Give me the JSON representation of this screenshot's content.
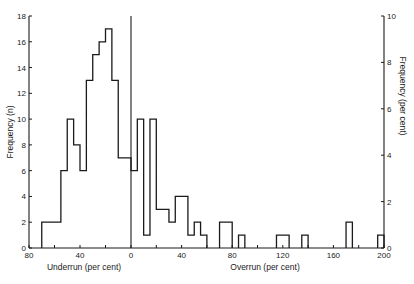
{
  "chart_data": {
    "type": "bar",
    "subtype": "histogram",
    "title": "",
    "xlabel_left": "Underrun (per cent)",
    "xlabel_right": "Overrun (per cent)",
    "ylabel_left": "Frequency (n)",
    "ylabel_right": "Frequency (per cent)",
    "x_ticks_underrun": [
      80,
      40,
      0
    ],
    "x_ticks_overrun": [
      40,
      80,
      120,
      160,
      200
    ],
    "y_ticks_left": [
      0,
      2,
      4,
      6,
      8,
      10,
      12,
      14,
      16,
      18
    ],
    "y_ticks_right": [
      0,
      2,
      4,
      6,
      8,
      10
    ],
    "ylim_left": [
      0,
      18
    ],
    "ylim_right": [
      0,
      10
    ],
    "xlim": [
      -80,
      200
    ],
    "bin_width_percent": 5,
    "grid": false,
    "legend": null,
    "bins": [
      {
        "from": -70,
        "to": -65,
        "n": 2
      },
      {
        "from": -65,
        "to": -60,
        "n": 2
      },
      {
        "from": -60,
        "to": -55,
        "n": 2
      },
      {
        "from": -55,
        "to": -50,
        "n": 6
      },
      {
        "from": -50,
        "to": -45,
        "n": 10
      },
      {
        "from": -45,
        "to": -40,
        "n": 8
      },
      {
        "from": -40,
        "to": -35,
        "n": 6
      },
      {
        "from": -35,
        "to": -30,
        "n": 13
      },
      {
        "from": -30,
        "to": -25,
        "n": 15
      },
      {
        "from": -25,
        "to": -20,
        "n": 16
      },
      {
        "from": -20,
        "to": -15,
        "n": 17
      },
      {
        "from": -15,
        "to": -10,
        "n": 13
      },
      {
        "from": -10,
        "to": -5,
        "n": 7
      },
      {
        "from": -5,
        "to": 0,
        "n": 7
      },
      {
        "from": 0,
        "to": 5,
        "n": 6
      },
      {
        "from": 5,
        "to": 10,
        "n": 10
      },
      {
        "from": 10,
        "to": 15,
        "n": 1
      },
      {
        "from": 15,
        "to": 20,
        "n": 10
      },
      {
        "from": 20,
        "to": 25,
        "n": 3
      },
      {
        "from": 25,
        "to": 30,
        "n": 3
      },
      {
        "from": 30,
        "to": 35,
        "n": 2
      },
      {
        "from": 35,
        "to": 40,
        "n": 4
      },
      {
        "from": 40,
        "to": 45,
        "n": 4
      },
      {
        "from": 45,
        "to": 50,
        "n": 1
      },
      {
        "from": 50,
        "to": 55,
        "n": 2
      },
      {
        "from": 55,
        "to": 60,
        "n": 1
      },
      {
        "from": 70,
        "to": 75,
        "n": 2
      },
      {
        "from": 75,
        "to": 80,
        "n": 2
      },
      {
        "from": 85,
        "to": 90,
        "n": 1
      },
      {
        "from": 115,
        "to": 120,
        "n": 1
      },
      {
        "from": 120,
        "to": 125,
        "n": 1
      },
      {
        "from": 135,
        "to": 140,
        "n": 1
      },
      {
        "from": 170,
        "to": 175,
        "n": 2
      },
      {
        "from": 195,
        "to": 200,
        "n": 1
      }
    ]
  },
  "labels": {
    "xlabel_left": "Underrun (per cent)",
    "xlabel_right": "Overrun (per cent)",
    "ylabel_left": "Frequency (n)",
    "ylabel_right": "Frequency (per cent)"
  }
}
